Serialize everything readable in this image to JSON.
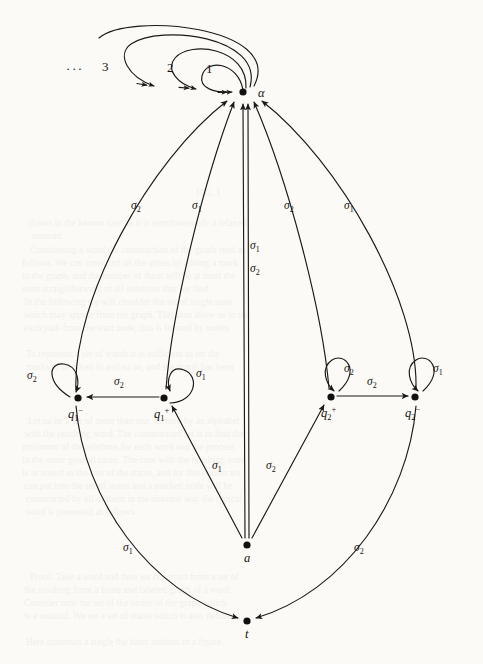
{
  "figure": {
    "kind": "state-transition-diagram",
    "background_color": "#fbfaf7",
    "ink_color": "#1a1a18",
    "canvas": {
      "width": 483,
      "height": 664
    }
  },
  "nodes": [
    {
      "id": "alpha",
      "label": "α",
      "label_base": "α",
      "sub": "",
      "sup": "",
      "x": 243,
      "y": 92,
      "label_x": 258,
      "label_y": 97
    },
    {
      "id": "q1minus",
      "label": "q₁⁻",
      "label_base": "q",
      "sub": "1",
      "sup": "−",
      "x": 78,
      "y": 398,
      "label_x": 68,
      "label_y": 418
    },
    {
      "id": "q1plus",
      "label": "q₁⁺",
      "label_base": "q",
      "sub": "1",
      "sup": "+",
      "x": 164,
      "y": 398,
      "label_x": 154,
      "label_y": 418
    },
    {
      "id": "q2plus",
      "label": "q₂⁺",
      "label_base": "q",
      "sub": "2",
      "sup": "+",
      "x": 331,
      "y": 397,
      "label_x": 321,
      "label_y": 417
    },
    {
      "id": "q2minus",
      "label": "q₂⁻",
      "label_base": "q",
      "sub": "2",
      "sup": "−",
      "x": 415,
      "y": 397,
      "label_x": 405,
      "label_y": 417
    },
    {
      "id": "a",
      "label": "a",
      "label_base": "a",
      "sub": "",
      "sup": "",
      "x": 247,
      "y": 545,
      "label_x": 244,
      "label_y": 562
    },
    {
      "id": "t",
      "label": "t",
      "label_base": "t",
      "sub": "",
      "sup": "",
      "x": 247,
      "y": 621,
      "label_x": 245,
      "label_y": 638
    }
  ],
  "loops": [
    {
      "id": "alpha-loop-1",
      "index_label": "1",
      "index_x": 206,
      "index_y": 73,
      "on": "alpha"
    },
    {
      "id": "alpha-loop-2",
      "index_label": "2",
      "index_x": 167,
      "index_y": 72,
      "on": "alpha"
    },
    {
      "id": "alpha-loop-3",
      "index_label": "3",
      "index_x": 102,
      "index_y": 71,
      "on": "alpha"
    },
    {
      "id": "alpha-loop-more",
      "index_label": "···",
      "index_x": 66,
      "index_y": 73,
      "on": "alpha"
    }
  ],
  "edges": [
    {
      "id": "e-q1minus-self",
      "from": "q1minus",
      "to": "q1minus",
      "label": "σ₂",
      "sym": "σ",
      "sub": "2",
      "label_x": 27,
      "label_y": 379
    },
    {
      "id": "e-q1plus-self",
      "from": "q1plus",
      "to": "q1plus",
      "label": "σ₁",
      "sym": "σ",
      "sub": "1",
      "label_x": 196,
      "label_y": 377
    },
    {
      "id": "e-q2plus-self",
      "from": "q2plus",
      "to": "q2plus",
      "label": "σ₂",
      "sym": "σ",
      "sub": "2",
      "label_x": 344,
      "label_y": 372
    },
    {
      "id": "e-q2minus-self",
      "from": "q2minus",
      "to": "q2minus",
      "label": "σ₁",
      "sym": "σ",
      "sub": "1",
      "label_x": 433,
      "label_y": 372
    },
    {
      "id": "e-q1plus-q1minus",
      "from": "q1plus",
      "to": "q1minus",
      "label": "σ₂",
      "sym": "σ",
      "sub": "2",
      "label_x": 114,
      "label_y": 385
    },
    {
      "id": "e-q2plus-q2minus",
      "from": "q2plus",
      "to": "q2minus",
      "label": "σ₂",
      "sym": "σ",
      "sub": "2",
      "label_x": 367,
      "label_y": 385
    },
    {
      "id": "e-q1minus-alpha",
      "from": "q1minus",
      "to": "alpha",
      "label": "σ₂",
      "sym": "σ",
      "sub": "2",
      "label_x": 131,
      "label_y": 209
    },
    {
      "id": "e-q1plus-alpha",
      "from": "q1plus",
      "to": "alpha",
      "label": "σ₁",
      "sym": "σ",
      "sub": "1",
      "label_x": 192,
      "label_y": 209
    },
    {
      "id": "e-q2plus-alpha",
      "from": "q2plus",
      "to": "alpha",
      "label": "σ₂",
      "sym": "σ",
      "sub": "2",
      "label_x": 284,
      "label_y": 209
    },
    {
      "id": "e-q2minus-alpha",
      "from": "q2minus",
      "to": "alpha",
      "label": "σ₁",
      "sym": "σ",
      "sub": "1",
      "label_x": 344,
      "label_y": 209
    },
    {
      "id": "e-a-alpha-s1",
      "from": "a",
      "to": "alpha",
      "label": "σ₁",
      "sym": "σ",
      "sub": "1",
      "label_x": 250,
      "label_y": 249
    },
    {
      "id": "e-a-alpha-s2",
      "from": "a",
      "to": "alpha",
      "label": "σ₂",
      "sym": "σ",
      "sub": "2",
      "label_x": 250,
      "label_y": 272
    },
    {
      "id": "e-a-q1plus",
      "from": "a",
      "to": "q1plus",
      "label": "σ₁",
      "sym": "σ",
      "sub": "1",
      "label_x": 212,
      "label_y": 469
    },
    {
      "id": "e-a-q2plus",
      "from": "a",
      "to": "q2plus",
      "label": "σ₂",
      "sym": "σ",
      "sub": "2",
      "label_x": 266,
      "label_y": 469
    },
    {
      "id": "e-q1minus-t",
      "from": "q1minus",
      "to": "t",
      "label": "σ₁",
      "sym": "σ",
      "sub": "1",
      "label_x": 123,
      "label_y": 551
    },
    {
      "id": "e-q2minus-t",
      "from": "q2minus",
      "to": "t",
      "label": "σ₂",
      "sym": "σ",
      "sub": "2",
      "label_x": 354,
      "label_y": 551
    }
  ],
  "ghost_text_lines": [
    {
      "x": 196,
      "y": 196,
      "text": "FIG. 1"
    },
    {
      "x": 28,
      "y": 226,
      "text": "chains in the known case as it is simultaneously a relaxed"
    },
    {
      "x": 32,
      "y": 239,
      "text": "monoid."
    },
    {
      "x": 30,
      "y": 253,
      "text": "Considering a word the construction of the graph read as"
    },
    {
      "x": 22,
      "y": 266,
      "text": "follows. We can construct all the states by adding a mark"
    },
    {
      "x": 22,
      "y": 279,
      "text": "to the graph, and the number of them will be at most the"
    },
    {
      "x": 22,
      "y": 292,
      "text": "most straightforward of all solutions that we find."
    },
    {
      "x": 24,
      "y": 305,
      "text": "In the following we will consider the set of single state"
    },
    {
      "x": 24,
      "y": 318,
      "text": "which may appear from the graph. This also allow us to use"
    },
    {
      "x": 24,
      "y": 331,
      "text": "each path from the start node; this is formed by nodes."
    },
    {
      "x": 26,
      "y": 357,
      "text": "To represent a set of words it is sufficient to set the"
    },
    {
      "x": 26,
      "y": 370,
      "text": "marks to be taken in and so on, and the graph has been"
    },
    {
      "x": 28,
      "y": 424,
      "text": "Let us be a set of more than one, formed by an alphabet"
    },
    {
      "x": 24,
      "y": 437,
      "text": "with the resulting word. The construction set is to find the"
    },
    {
      "x": 22,
      "y": 450,
      "text": "minimum of the relations for each word and the process"
    },
    {
      "x": 22,
      "y": 463,
      "text": "in the more general cases. The case with the resulting state"
    },
    {
      "x": 22,
      "y": 476,
      "text": "is as sound as the one of the states, and for this reason we"
    },
    {
      "x": 24,
      "y": 489,
      "text": "can put into the set of states and a marked node will be"
    },
    {
      "x": 26,
      "y": 502,
      "text": "constructed by all of them in the obvious way the typical"
    },
    {
      "x": 26,
      "y": 515,
      "text": "word is presented as follows."
    },
    {
      "x": 30,
      "y": 580,
      "text": "Proof. Take a word and then we construct from a set of"
    },
    {
      "x": 24,
      "y": 593,
      "text": "the resulting form a finite and labeled graph of a word."
    },
    {
      "x": 24,
      "y": 606,
      "text": "Consider now the set of the nodes of the graph which"
    },
    {
      "x": 24,
      "y": 619,
      "text": "is a monoid. We set a set of states which is also defined"
    },
    {
      "x": 26,
      "y": 645,
      "text": "Here construct a single the basic notions in a figure."
    }
  ]
}
